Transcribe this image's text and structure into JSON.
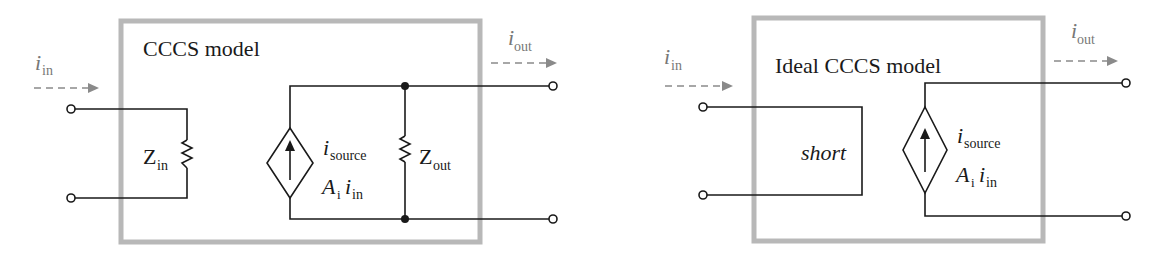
{
  "diagrams": [
    {
      "title": "CCCS model",
      "input_current": {
        "symbol": "i",
        "subscript": "in"
      },
      "output_current": {
        "symbol": "i",
        "subscript": "out"
      },
      "input_impedance": {
        "symbol": "Z",
        "subscript": "in"
      },
      "output_impedance": {
        "symbol": "Z",
        "subscript": "out"
      },
      "source_label": {
        "symbol": "i",
        "subscript": "source"
      },
      "source_value": {
        "gain": "A",
        "gain_sub": "i",
        "symbol": "i",
        "subscript": "in"
      }
    },
    {
      "title": "Ideal CCCS model",
      "input_current": {
        "symbol": "i",
        "subscript": "in"
      },
      "output_current": {
        "symbol": "i",
        "subscript": "out"
      },
      "short_label": "short",
      "source_label": {
        "symbol": "i",
        "subscript": "source"
      },
      "source_value": {
        "gain": "A",
        "gain_sub": "i",
        "symbol": "i",
        "subscript": "in"
      }
    }
  ],
  "colors": {
    "wire": "#1a1a1a",
    "box_border": "#b8b8b8",
    "current_arrow": "#8a8a8a"
  }
}
